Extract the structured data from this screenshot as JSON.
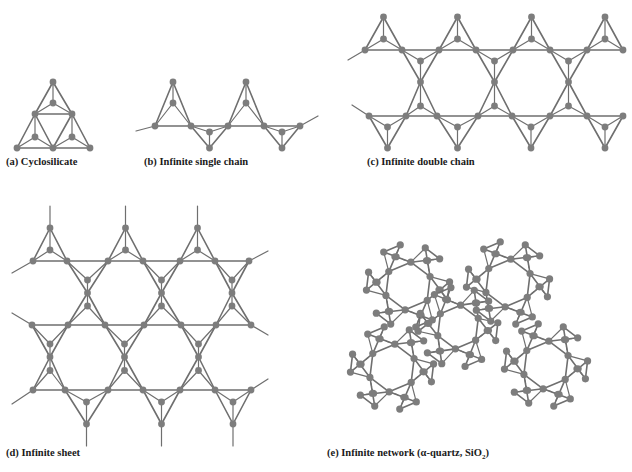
{
  "figure": {
    "colors": {
      "edge": "#6f6f6f",
      "node": "#7d7d7d",
      "background": "#ffffff",
      "text": "#1a1a1a"
    },
    "panels": [
      {
        "id": "a",
        "caption": "(a) Cyclosilicate",
        "caption_pos": [
          6,
          165
        ]
      },
      {
        "id": "b",
        "caption": "(b) Infinite single chain",
        "caption_pos": [
          144,
          165
        ]
      },
      {
        "id": "c",
        "caption": "(c) Infinite double chain",
        "caption_pos": [
          367,
          165
        ]
      },
      {
        "id": "d",
        "caption": "(d) Infinite sheet",
        "caption_pos": [
          6,
          456
        ]
      },
      {
        "id": "e",
        "caption_prefix": "(e) Infinite network (",
        "caption_alpha": "α-quartz, SiO",
        "caption_sub": "2",
        "caption_suffix": ")",
        "caption_pos": [
          327,
          456
        ]
      }
    ]
  }
}
